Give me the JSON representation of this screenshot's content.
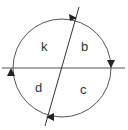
{
  "diagram": {
    "type": "circle-divided-by-two-lines",
    "circle": {
      "cx": 62,
      "cy": 68,
      "r": 49
    },
    "horizontal_line": {
      "x1": 2,
      "y1": 68,
      "x2": 125,
      "y2": 68
    },
    "slanted_line": {
      "x1": 79,
      "y1": 7,
      "x2": 45,
      "y2": 126
    },
    "regions": [
      {
        "id": "k",
        "label": "k",
        "x": 44,
        "y": 51
      },
      {
        "id": "b",
        "label": "b",
        "x": 84,
        "y": 51
      },
      {
        "id": "d",
        "label": "d",
        "x": 39,
        "y": 92
      },
      {
        "id": "c",
        "label": "c",
        "x": 83,
        "y": 94
      }
    ],
    "arrows": [
      {
        "position": "top",
        "direction": "right"
      },
      {
        "position": "right",
        "direction": "down"
      },
      {
        "position": "bottom",
        "direction": "left"
      },
      {
        "position": "left",
        "direction": "up"
      }
    ],
    "colors": {
      "stroke": "#444444",
      "text": "#333333"
    }
  }
}
